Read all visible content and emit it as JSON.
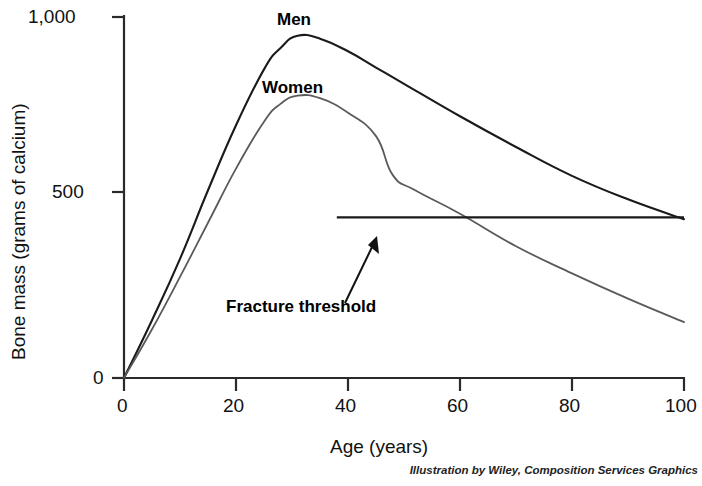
{
  "chart_data": {
    "type": "line",
    "title": "",
    "xlabel": "Age (years)",
    "ylabel": "Bone mass (grams of calcium)",
    "xlim": [
      0,
      100
    ],
    "ylim": [
      0,
      1000
    ],
    "xticks": [
      "0",
      "20",
      "40",
      "60",
      "80",
      "100"
    ],
    "xtick_values": [
      0,
      20,
      40,
      60,
      80,
      100
    ],
    "yticks": [
      "0",
      "500",
      "1,000"
    ],
    "ytick_values": [
      0,
      500,
      1000
    ],
    "grid": false,
    "legend_position": "inline-annotations",
    "series": [
      {
        "name": "Men",
        "label": "Men",
        "color": "#1a1a1a",
        "x": [
          0,
          5,
          10,
          15,
          20,
          25,
          28,
          31,
          35,
          40,
          45,
          50,
          60,
          70,
          80,
          90,
          100
        ],
        "values": [
          0,
          160,
          330,
          520,
          700,
          855,
          915,
          948,
          940,
          905,
          860,
          815,
          725,
          640,
          560,
          495,
          440
        ]
      },
      {
        "name": "Women",
        "label": "Women",
        "color": "#4a4a4a",
        "x": [
          0,
          5,
          10,
          15,
          20,
          25,
          28,
          31,
          35,
          40,
          45,
          48,
          52,
          60,
          70,
          80,
          90,
          100
        ],
        "values": [
          0,
          135,
          280,
          430,
          580,
          710,
          760,
          782,
          775,
          735,
          670,
          562,
          520,
          455,
          365,
          290,
          220,
          155
        ]
      }
    ],
    "annotations": [
      {
        "name": "fracture-threshold",
        "label": "Fracture threshold",
        "type": "hline",
        "value": 445,
        "x_start": 38,
        "x_end": 100,
        "arrow": true
      },
      {
        "name": "men-label",
        "label": "Men",
        "x": 31,
        "y": 1000
      },
      {
        "name": "women-label",
        "label": "Women",
        "x": 31,
        "y": 800
      }
    ]
  },
  "figure": {
    "ylabel": "Bone mass (grams of calcium)",
    "xlabel": "Age (years)",
    "ytick_labels": [
      "1,000",
      "500",
      "0"
    ],
    "xtick_labels": [
      "0",
      "20",
      "40",
      "60",
      "80",
      "100"
    ],
    "men_label": "Men",
    "women_label": "Women",
    "threshold_label": "Fracture threshold",
    "credit": "Illustration by Wiley, Composition Services Graphics",
    "axis_color": "#2a2a2a"
  }
}
